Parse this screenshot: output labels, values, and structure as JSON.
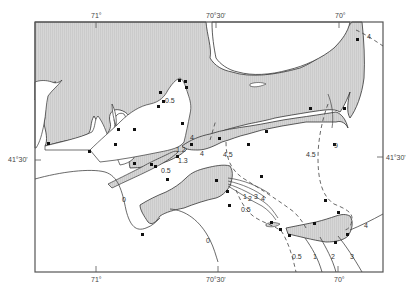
{
  "map": {
    "frame_color": "#555555",
    "land_color": "#d4d4d4",
    "water_color": "#ffffff",
    "axis_labels": {
      "top": [
        "71°",
        "70°30'",
        "70°"
      ],
      "bottom": [
        "71°",
        "70°30'",
        "70°"
      ],
      "left": "41°30'",
      "right": "41°30'"
    },
    "contour_labels": [
      {
        "text": "0.5",
        "x": 165,
        "y": 103
      },
      {
        "text": "4",
        "x": 192,
        "y": 140
      },
      {
        "text": "1.2",
        "x": 179,
        "y": 151
      },
      {
        "text": "1.3",
        "x": 180,
        "y": 163
      },
      {
        "text": "0.5",
        "x": 161,
        "y": 172
      },
      {
        "text": "4",
        "x": 202,
        "y": 155
      },
      {
        "text": "4.5",
        "x": 223,
        "y": 157
      },
      {
        "text": "0",
        "x": 124,
        "y": 201
      },
      {
        "text": "1",
        "x": 244,
        "y": 195
      },
      {
        "text": "2",
        "x": 248,
        "y": 201
      },
      {
        "text": "3",
        "x": 254,
        "y": 198
      },
      {
        "text": "4",
        "x": 261,
        "y": 201
      },
      {
        "text": "0.5",
        "x": 246,
        "y": 212
      },
      {
        "text": "4.5",
        "x": 310,
        "y": 157
      },
      {
        "text": "9",
        "x": 336,
        "y": 146
      },
      {
        "text": "4",
        "x": 365,
        "y": 226
      },
      {
        "text": "4",
        "x": 368,
        "y": 37
      },
      {
        "text": "0.5",
        "x": 294,
        "y": 258
      },
      {
        "text": "1",
        "x": 312,
        "y": 258
      },
      {
        "text": "2",
        "x": 331,
        "y": 258
      },
      {
        "text": "3",
        "x": 350,
        "y": 258
      },
      {
        "text": "0",
        "x": 206,
        "y": 242
      }
    ]
  }
}
